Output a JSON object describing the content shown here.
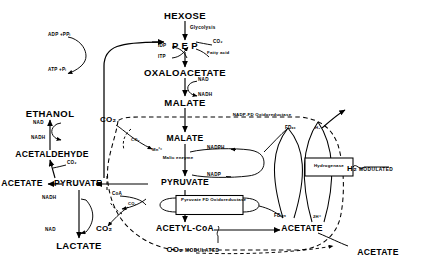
{
  "figure": {
    "type": "biochemical-pathway-diagram"
  },
  "metabolites": {
    "hexose": "HEXOSE",
    "pep": "P E P",
    "oxaloacetate": "OXALOACETATE",
    "malate_outer": "MALATE",
    "malate_inner": "MALATE",
    "ethanol": "ETHANOL",
    "acetaldehyde": "ACETALDEHYDE",
    "acetate_left": "ACETATE",
    "pyruvate_outer": "PYRUVATE",
    "pyruvate_inner": "PYRUVATE",
    "lactate": "LACTATE",
    "acetyl_coa": "ACETYL-CoA",
    "acetate_inner": "ACETATE",
    "acetate_outer": "ACETATE"
  },
  "enzymes": {
    "malic_enzyme": "Malic enzyme",
    "pyruvate_fd_oxidoreductase": "Pyruvate FD Oxidoreductase",
    "nadp_fd_oxidoreductase": "NADP-FD Oxidoreductase",
    "hydrogenase": "Hydrogenase"
  },
  "cofactors": {
    "glycolysis": "Glycolysis",
    "co2_pep": "CO₂",
    "idp": "IDP",
    "itp": "ITP",
    "fatty_acid": "Fatty acid",
    "adp_ppi": "ADP +PPᵢ",
    "atp_pi": "ATP +Pᵢ",
    "nad_oaa": "NAD",
    "nadh_oaa": "NADH",
    "nad_etoh": "NAD",
    "nadh_etoh": "NADH",
    "co2_acald": "CO₂",
    "nadh_lac": "NADH",
    "nad_lac": "NAD",
    "co2_outer_upper": "CO₂",
    "co2_inner_upper": "CO₂",
    "co2_outer_lower": "CO₂",
    "co2_inner_lower": "CO₂",
    "mn": "Mn²⁺",
    "nadph": "NADPH",
    "nadp": "NADP",
    "coa": "CoA",
    "fd_ox": "FDₒₓ",
    "fd_red": "FDᵣₑₔ",
    "h2_inner": "H₂",
    "h2_outer": "H₂",
    "two_h_plus": "2H⁺"
  },
  "modulators": {
    "h2_modulated": "H₂ MODULATED",
    "co2_modulated": "CO₂ MODULATED"
  },
  "colors": {
    "ink": "#000000",
    "background": "#ffffff"
  }
}
